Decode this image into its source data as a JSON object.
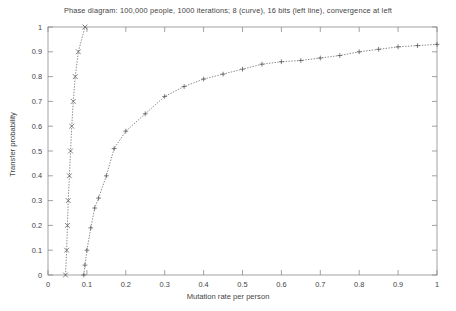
{
  "chart_data": {
    "type": "line",
    "title": "Phase diagram: 100,000 people, 1000 iterations; 8 (curve), 16 bits (left line), convergence at left",
    "xlabel": "Mutation rate per person",
    "ylabel": "Transfer probability",
    "xlim": [
      0,
      1
    ],
    "ylim": [
      0,
      1
    ],
    "grid": false,
    "legend_position": "none",
    "xticks": [
      "0",
      "0.1",
      "0.2",
      "0.3",
      "0.4",
      "0.5",
      "0.6",
      "0.7",
      "0.8",
      "0.9",
      "1"
    ],
    "xtick_values": [
      0,
      0.1,
      0.2,
      0.3,
      0.4,
      0.5,
      0.6,
      0.7,
      0.8,
      0.9,
      1
    ],
    "yticks": [
      "0",
      "0.1",
      "0.2",
      "0.3",
      "0.4",
      "0.5",
      "0.6",
      "0.7",
      "0.8",
      "0.9",
      "1"
    ],
    "ytick_values": [
      0,
      0.1,
      0.2,
      0.3,
      0.4,
      0.5,
      0.6,
      0.7,
      0.8,
      0.9,
      1
    ],
    "series": [
      {
        "name": "16 bits (left line)",
        "marker": "x",
        "linestyle": "dotted",
        "color": "#555555",
        "points": [
          [
            0.045,
            0.0
          ],
          [
            0.048,
            0.1
          ],
          [
            0.05,
            0.2
          ],
          [
            0.052,
            0.3
          ],
          [
            0.055,
            0.4
          ],
          [
            0.058,
            0.5
          ],
          [
            0.061,
            0.6
          ],
          [
            0.065,
            0.7
          ],
          [
            0.07,
            0.8
          ],
          [
            0.078,
            0.9
          ],
          [
            0.095,
            1.0
          ]
        ]
      },
      {
        "name": "8 bits (curve)",
        "marker": "+",
        "linestyle": "dotted",
        "color": "#555555",
        "points": [
          [
            0.092,
            0.0
          ],
          [
            0.095,
            0.04
          ],
          [
            0.1,
            0.1
          ],
          [
            0.11,
            0.19
          ],
          [
            0.12,
            0.27
          ],
          [
            0.13,
            0.31
          ],
          [
            0.15,
            0.4
          ],
          [
            0.17,
            0.51
          ],
          [
            0.2,
            0.58
          ],
          [
            0.25,
            0.65
          ],
          [
            0.3,
            0.72
          ],
          [
            0.35,
            0.76
          ],
          [
            0.4,
            0.79
          ],
          [
            0.45,
            0.81
          ],
          [
            0.5,
            0.83
          ],
          [
            0.55,
            0.85
          ],
          [
            0.6,
            0.86
          ],
          [
            0.65,
            0.865
          ],
          [
            0.7,
            0.875
          ],
          [
            0.75,
            0.885
          ],
          [
            0.8,
            0.9
          ],
          [
            0.85,
            0.91
          ],
          [
            0.9,
            0.92
          ],
          [
            0.95,
            0.925
          ],
          [
            1.0,
            0.93
          ]
        ]
      }
    ]
  },
  "plot_geometry": {
    "left": 48,
    "right": 437,
    "top": 27,
    "bottom": 275
  }
}
